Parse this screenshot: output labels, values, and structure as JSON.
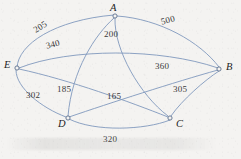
{
  "figure": {
    "type": "weighted-graph-diagram",
    "background_color": "#f4f3f1",
    "edge_color": "#8099bd",
    "label_color": "#2b2b2b"
  },
  "nodes": [
    {
      "id": "A",
      "label": "A",
      "x": 115,
      "y": 16,
      "label_x": 110,
      "label_y": 3
    },
    {
      "id": "B",
      "label": "B",
      "x": 219,
      "y": 69,
      "label_x": 226,
      "label_y": 62
    },
    {
      "id": "C",
      "label": "C",
      "x": 170,
      "y": 118,
      "label_x": 176,
      "label_y": 119
    },
    {
      "id": "D",
      "label": "D",
      "x": 68,
      "y": 118,
      "label_x": 58,
      "label_y": 119
    },
    {
      "id": "E",
      "label": "E",
      "x": 17,
      "y": 68,
      "label_x": 4,
      "label_y": 60
    }
  ],
  "edges": [
    {
      "from": "E",
      "to": "A",
      "weight": "205",
      "label_x": 32,
      "label_y": 27,
      "rotate": -32
    },
    {
      "from": "A",
      "to": "B",
      "weight": "500",
      "label_x": 160,
      "label_y": 18,
      "rotate": -15
    },
    {
      "from": "E",
      "to": "B",
      "weight": "340",
      "label_x": 45,
      "label_y": 42,
      "rotate": -14
    },
    {
      "from": "A",
      "to": "C",
      "weight": "200",
      "label_x": 104,
      "label_y": 30,
      "rotate": 0
    },
    {
      "from": "D",
      "to": "B",
      "weight": "360",
      "label_x": 155,
      "label_y": 62,
      "rotate": 0
    },
    {
      "from": "B",
      "to": "C",
      "weight": "305",
      "label_x": 173,
      "label_y": 85,
      "rotate": 0
    },
    {
      "from": "A",
      "to": "D",
      "weight": "185",
      "label_x": 57,
      "label_y": 85,
      "rotate": 0
    },
    {
      "from": "E",
      "to": "C",
      "weight": "165",
      "label_x": 107,
      "label_y": 92,
      "rotate": 0
    },
    {
      "from": "E",
      "to": "D",
      "weight": "302",
      "label_x": 26,
      "label_y": 91,
      "rotate": 0
    },
    {
      "from": "D",
      "to": "C",
      "weight": "320",
      "label_x": 103,
      "label_y": 135,
      "rotate": 0
    }
  ],
  "edge_paths": {
    "E_A": "M 17 68 C 18 44 55 20 114 15",
    "A_B": "M 117 16 C 160 19 200 42 219 67",
    "E_B": "M 19 68 C 70 48 160 48 218 68",
    "A_C": "M 115 18 C 114 50 140 95 168 116",
    "D_B": "M 69 117 C 110 103 175 82 218 70",
    "B_C": "M 219 71 C 205 80 182 100 171 116",
    "A_D": "M 114 18 C 95 35 72 70 68 116",
    "E_C": "M 19 69 C 70 80 130 102 168 117",
    "E_D": "M 16 70 C 16 88 42 108 66 117",
    "D_C": "M 69 119 C 95 132 145 130 170 120"
  },
  "watermark": ""
}
